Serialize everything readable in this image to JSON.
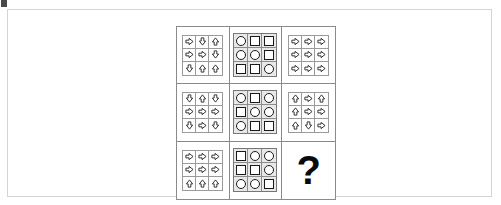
{
  "figure": {
    "type": "progressive-matrix-puzzle",
    "rows": 3,
    "columns": 3,
    "frame_color": "#d4d4d4",
    "grid_line_color": "#8a8a8a",
    "shape_outline_color": "#1a1a1a",
    "shape_panel_background": "#e8e8e8"
  },
  "cells": [
    {
      "position": "row1-col1",
      "kind": "arrows",
      "glyphs": [
        "right",
        "down",
        "up",
        "right",
        "right",
        "down",
        "down",
        "up",
        "up"
      ]
    },
    {
      "position": "row1-col2",
      "kind": "shapes",
      "glyphs": [
        "circle",
        "square",
        "square",
        "circle",
        "circle",
        "square",
        "square",
        "square",
        "circle"
      ]
    },
    {
      "position": "row1-col3",
      "kind": "arrows",
      "glyphs": [
        "right",
        "right",
        "right",
        "right",
        "right",
        "right",
        "right",
        "right",
        "right"
      ]
    },
    {
      "position": "row2-col1",
      "kind": "arrows",
      "glyphs": [
        "down",
        "up",
        "down",
        "right",
        "right",
        "right",
        "down",
        "right",
        "down"
      ]
    },
    {
      "position": "row2-col2",
      "kind": "shapes",
      "glyphs": [
        "circle",
        "square",
        "circle",
        "square",
        "circle",
        "circle",
        "circle",
        "square",
        "square"
      ]
    },
    {
      "position": "row2-col3",
      "kind": "arrows",
      "glyphs": [
        "up",
        "right",
        "up",
        "up",
        "right",
        "right",
        "up",
        "down",
        "right"
      ]
    },
    {
      "position": "row3-col1",
      "kind": "arrows",
      "glyphs": [
        "right",
        "right",
        "right",
        "right",
        "right",
        "right",
        "up",
        "up",
        "up"
      ]
    },
    {
      "position": "row3-col2",
      "kind": "shapes",
      "glyphs": [
        "square",
        "circle",
        "circle",
        "square",
        "square",
        "circle",
        "circle",
        "circle",
        "square"
      ]
    },
    {
      "position": "row3-col3",
      "kind": "question",
      "label": "?"
    }
  ]
}
